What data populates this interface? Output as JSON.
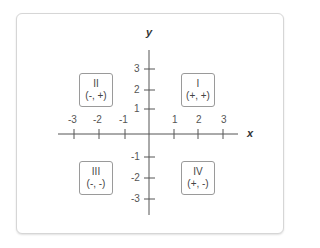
{
  "diagram": {
    "axes": {
      "x_label": "x",
      "y_label": "y",
      "x_ticks": [
        "-3",
        "-2",
        "-1",
        "1",
        "2",
        "3"
      ],
      "y_ticks": [
        "3",
        "2",
        "1",
        "-1",
        "-2",
        "-3"
      ]
    },
    "quadrants": [
      {
        "numeral": "II",
        "signs": "(-, +)"
      },
      {
        "numeral": "I",
        "signs": "(+, +)"
      },
      {
        "numeral": "III",
        "signs": "(-, -)"
      },
      {
        "numeral": "IV",
        "signs": "(+, -)"
      }
    ],
    "colors": {
      "axis": "#555555",
      "text": "#444444",
      "box_border": "#9a9a9a",
      "card_border": "#d6d6d6"
    }
  }
}
